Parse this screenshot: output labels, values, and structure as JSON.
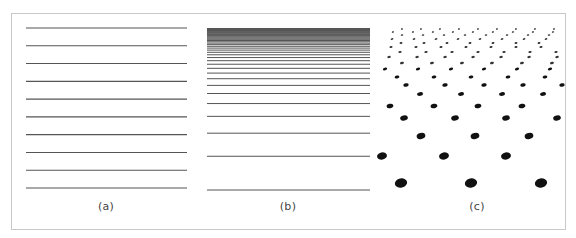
{
  "figure": {
    "colors": {
      "frame": "#c8c8c8",
      "line": "#555555",
      "dot": "#111111",
      "caption": "#444444",
      "background": "#ffffff"
    },
    "panels": [
      {
        "id": "a",
        "caption": "(a)",
        "type": "uniform-lines",
        "line_count": 10
      },
      {
        "id": "b",
        "caption": "(b)",
        "type": "perspective-lines",
        "line_count": 38
      },
      {
        "id": "c",
        "caption": "(c)",
        "type": "perspective-dot-grid"
      }
    ]
  }
}
